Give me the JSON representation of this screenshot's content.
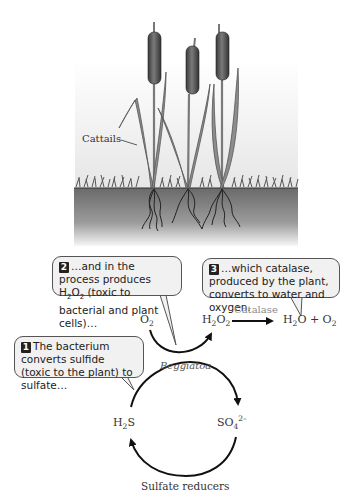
{
  "illustration": {
    "plant_label": "Cattails",
    "colors": {
      "soil_top": "#6e6e6e",
      "soil_bottom": "#f4f4f4",
      "sky_top": "#ffffff",
      "sky_bottom": "#e9e9e9",
      "leaf": "#8a8a8a",
      "cattail_head": "#4a4a4a"
    }
  },
  "callouts": [
    {
      "number": "1",
      "text": "The bacterium converts sulfide (toxic to the plant) to sulfate…"
    },
    {
      "number": "2",
      "text_before": "…and in the process produces H",
      "sub1": "2",
      "mid": "O",
      "sub2": "2",
      "text_after": " (toxic to bacterial and plant cells)…"
    },
    {
      "number": "3",
      "text": "…which catalase, produced by the plant, converts to water and oxygen."
    }
  ],
  "reactions": {
    "o2": {
      "base": "O",
      "sub": "2"
    },
    "h2o2": {
      "a": "H",
      "s1": "2",
      "b": "O",
      "s2": "2"
    },
    "enzyme_label": "Catalase",
    "products": {
      "a": "H",
      "s1": "2",
      "b": "O + O",
      "s2": "2"
    },
    "beggiatoa_label": "Beggiatoa",
    "h2s": {
      "a": "H",
      "s1": "2",
      "b": "S"
    },
    "so4": {
      "a": "SO",
      "s1": "4",
      "sup": "2–"
    },
    "sulfate_reducers_label": "Sulfate reducers"
  }
}
